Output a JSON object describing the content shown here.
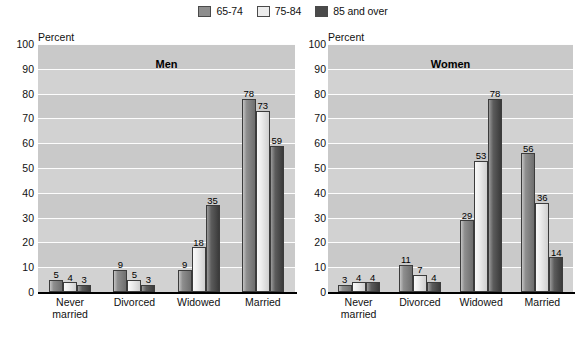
{
  "legend": {
    "items": [
      {
        "label": "65-74",
        "color": "#8e8e8e",
        "name": "legend-swatch-65-74"
      },
      {
        "label": "75-84",
        "color": "#ededed",
        "name": "legend-swatch-75-84"
      },
      {
        "label": "85 and over",
        "color": "#4a4a4a",
        "name": "legend-swatch-85-and-over"
      }
    ]
  },
  "axis": {
    "percent_label": "Percent",
    "ticks": [
      "100",
      "90",
      "80",
      "70",
      "60",
      "50",
      "40",
      "30",
      "20",
      "10",
      "0"
    ]
  },
  "panels": {
    "men": {
      "title": "Men",
      "percent_label": "Percent",
      "categories": [
        {
          "line1": "Never",
          "line2": "married"
        },
        {
          "line1": "Divorced",
          "line2": ""
        },
        {
          "line1": "Widowed",
          "line2": ""
        },
        {
          "line1": "Married",
          "line2": ""
        }
      ]
    },
    "women": {
      "title": "Women",
      "percent_label": "Percent",
      "categories": [
        {
          "line1": "Never",
          "line2": "married"
        },
        {
          "line1": "Divorced",
          "line2": ""
        },
        {
          "line1": "Widowed",
          "line2": ""
        },
        {
          "line1": "Married",
          "line2": ""
        }
      ]
    }
  },
  "chart_data": [
    {
      "type": "bar",
      "title": "Men",
      "xlabel": "",
      "ylabel": "Percent",
      "ylim": [
        0,
        100
      ],
      "ytick_step": 10,
      "grid": true,
      "legend_position": "top-center",
      "categories": [
        "Never married",
        "Divorced",
        "Widowed",
        "Married"
      ],
      "series": [
        {
          "name": "65-74",
          "color": "#8e8e8e",
          "values": [
            5,
            9,
            9,
            78
          ]
        },
        {
          "name": "75-84",
          "color": "#ededed",
          "values": [
            4,
            5,
            18,
            73
          ]
        },
        {
          "name": "85 and over",
          "color": "#4a4a4a",
          "values": [
            3,
            3,
            35,
            59
          ]
        }
      ]
    },
    {
      "type": "bar",
      "title": "Women",
      "xlabel": "",
      "ylabel": "Percent",
      "ylim": [
        0,
        100
      ],
      "ytick_step": 10,
      "grid": true,
      "legend_position": "top-center",
      "categories": [
        "Never married",
        "Divorced",
        "Widowed",
        "Married"
      ],
      "series": [
        {
          "name": "65-74",
          "color": "#8e8e8e",
          "values": [
            3,
            11,
            29,
            56
          ]
        },
        {
          "name": "75-84",
          "color": "#ededed",
          "values": [
            4,
            7,
            53,
            36
          ]
        },
        {
          "name": "85 and over",
          "color": "#4a4a4a",
          "values": [
            4,
            4,
            78,
            14
          ]
        }
      ]
    }
  ]
}
